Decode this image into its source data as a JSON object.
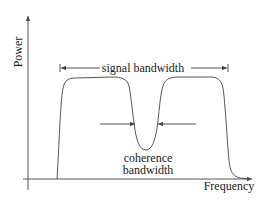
{
  "diagram": {
    "title": "",
    "axes": {
      "y_label": "Power",
      "x_label": "Frequency"
    },
    "annotations": {
      "signal_bandwidth": "signal bandwidth",
      "coherence_line1": "coherence",
      "coherence_line2": "bandwidth"
    },
    "colors": {
      "line": "#555555",
      "text": "#1a1a1a",
      "background": "#ffffff"
    }
  }
}
